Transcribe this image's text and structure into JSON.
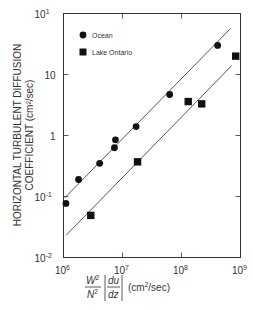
{
  "chart_data": {
    "type": "scatter",
    "title": "",
    "xscale": "log",
    "yscale": "log",
    "xlabel": "W²/N² |du/dz| (cm²/sec)",
    "xlabel_parts": {
      "num": "W",
      "num_sup": "2",
      "den": "N",
      "den_sup": "2",
      "frac2_num": "du",
      "frac2_den": "dz",
      "units": "(cm",
      "units_sup": "2",
      "units_tail": "/sec)"
    },
    "ylabel_line1": "HORIZONTAL TURBULENT DIFFUSION",
    "ylabel_line2": "COEFFICIENT (cm²/sec)",
    "xlim": [
      1000000.0,
      1000000000.0
    ],
    "ylim": [
      0.01,
      100
    ],
    "x_ticks": [
      {
        "base": "10",
        "exp": "6",
        "value": 1000000.0
      },
      {
        "base": "10",
        "exp": "7",
        "value": 10000000.0
      },
      {
        "base": "10",
        "exp": "8",
        "value": 100000000.0
      },
      {
        "base": "10",
        "exp": "9",
        "value": 1000000000.0
      }
    ],
    "y_ticks": [
      {
        "base": "10",
        "exp": "1",
        "value": 100
      },
      {
        "base": "10",
        "exp": "",
        "value": 10
      },
      {
        "base": "1",
        "exp": "",
        "value": 1
      },
      {
        "base": "10",
        "exp": "-1",
        "value": 0.1
      },
      {
        "base": "10",
        "exp": "-2",
        "value": 0.01
      }
    ],
    "grid": false,
    "legend_position": "upper-left",
    "series": [
      {
        "name": "Ocean",
        "marker": "circle",
        "color": "#111111",
        "points": [
          {
            "x": 1100000.0,
            "y": 0.077
          },
          {
            "x": 1800000.0,
            "y": 0.19
          },
          {
            "x": 4100000.0,
            "y": 0.35
          },
          {
            "x": 7300000.0,
            "y": 0.63
          },
          {
            "x": 7600000.0,
            "y": 0.85
          },
          {
            "x": 17000000.0,
            "y": 1.4
          },
          {
            "x": 63000000.0,
            "y": 4.7
          },
          {
            "x": 410000000.0,
            "y": 30
          }
        ],
        "fit_line": {
          "x1": 1050000.0,
          "y1": 0.095,
          "x2": 680000000.0,
          "y2": 57
        }
      },
      {
        "name": "Lake Ontario",
        "marker": "square",
        "color": "#111111",
        "points": [
          {
            "x": 2900000.0,
            "y": 0.049
          },
          {
            "x": 18000000.0,
            "y": 0.37
          },
          {
            "x": 130000000.0,
            "y": 3.6
          },
          {
            "x": 220000000.0,
            "y": 3.3
          },
          {
            "x": 830000000.0,
            "y": 20
          }
        ],
        "fit_line": {
          "x1": 1100000.0,
          "y1": 0.023,
          "x2": 710000000.0,
          "y2": 14
        }
      }
    ]
  }
}
